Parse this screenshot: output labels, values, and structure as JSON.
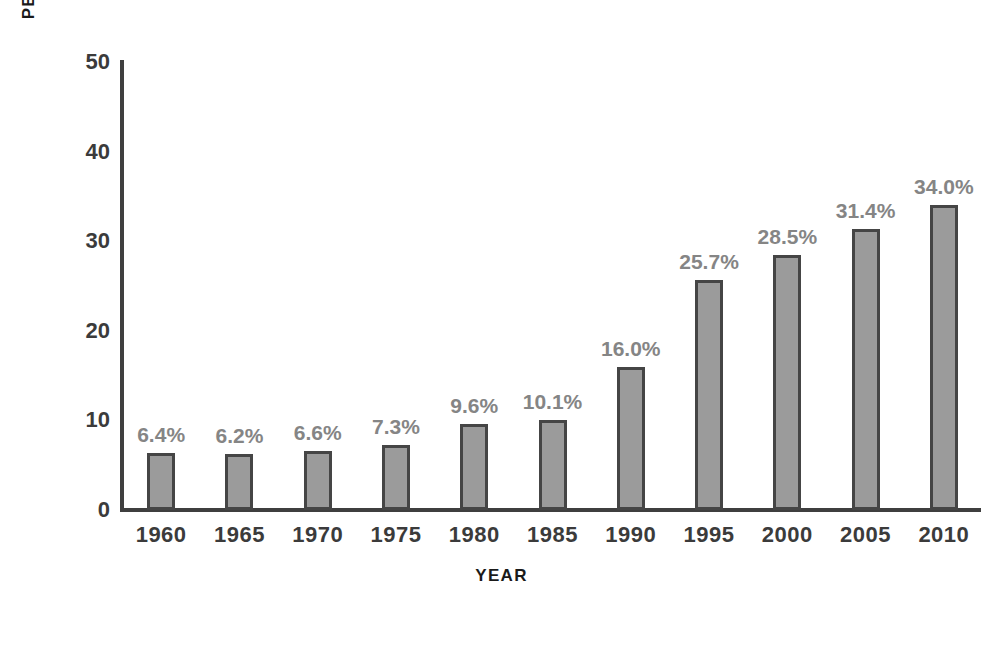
{
  "chart_data": {
    "type": "bar",
    "title": "",
    "xlabel": "YEAR",
    "ylabel": "PERCENT OF WASTE RECYCLED",
    "categories": [
      "1960",
      "1965",
      "1970",
      "1975",
      "1980",
      "1985",
      "1990",
      "1995",
      "2000",
      "2005",
      "2010"
    ],
    "values": [
      6.4,
      6.2,
      6.6,
      7.3,
      9.6,
      10.1,
      16.0,
      25.7,
      28.5,
      31.4,
      34.0
    ],
    "data_labels": [
      "6.4%",
      "6.2%",
      "6.6%",
      "7.3%",
      "9.6%",
      "10.1%",
      "16.0%",
      "25.7%",
      "28.5%",
      "31.4%",
      "34.0%"
    ],
    "ylim": [
      0,
      50
    ],
    "yticks": [
      0,
      10,
      20,
      30,
      40,
      50
    ],
    "ytick_labels": [
      "0",
      "10",
      "20",
      "30",
      "40",
      "50"
    ],
    "grid": false,
    "legend": null,
    "colors": {
      "bar_fill": "#9b9b9b",
      "bar_border": "#454545",
      "axis": "#3f3f3f",
      "tick_text": "#3b3b3b",
      "data_label_text": "#858585",
      "axis_title": "#1a1a1a",
      "background": "#ffffff"
    }
  }
}
